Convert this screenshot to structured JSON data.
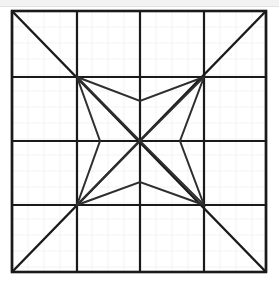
{
  "figure": {
    "title": "Concave four-pointed star inscribed in a gridded square",
    "canvas": {
      "width": 279,
      "height": 282
    },
    "colors": {
      "background": "#ffffff",
      "top_band": "#f2f2f2",
      "grid_major": "#1a1a1a",
      "grid_faint": "#f0f0f0",
      "star_stroke": "#2e2e2e",
      "diagonal_stroke": "#1a1a1a"
    },
    "stroke_widths": {
      "outer_border": 2.6,
      "grid_major": 2.2,
      "grid_faint": 0.8,
      "diagonal": 2.4,
      "star": 2.0
    },
    "square": {
      "left": 12,
      "top": 11,
      "right": 266,
      "bottom": 272,
      "width": 254,
      "height": 261
    },
    "grid": {
      "columns": 4,
      "rows": 4,
      "vertical_lines_x": [
        12,
        77,
        140,
        204,
        266
      ],
      "horizontal_lines_y": [
        11,
        77,
        141,
        205,
        272
      ],
      "faint_subdivision_step": 16
    },
    "diagonals": [
      {
        "name": "diagonal-top-left-to-bottom-right",
        "x1": 12,
        "y1": 11,
        "x2": 266,
        "y2": 272
      },
      {
        "name": "diagonal-top-right-to-bottom-left",
        "x1": 266,
        "y1": 11,
        "x2": 12,
        "y2": 272
      }
    ],
    "center": {
      "x": 140,
      "y": 141
    },
    "star": {
      "name": "concave-four-pointed-star",
      "point_count": 4,
      "outer_points": [
        {
          "label": "top-left",
          "x": 77,
          "y": 77
        },
        {
          "label": "top-right",
          "x": 204,
          "y": 77
        },
        {
          "label": "bottom-right",
          "x": 204,
          "y": 205
        },
        {
          "label": "bottom-left",
          "x": 77,
          "y": 205
        }
      ],
      "inner_points": [
        {
          "label": "top",
          "x": 140,
          "y": 101
        },
        {
          "label": "right",
          "x": 180,
          "y": 141
        },
        {
          "label": "bottom",
          "x": 140,
          "y": 182
        },
        {
          "label": "left",
          "x": 100,
          "y": 141
        }
      ],
      "outline_path": "M 77 77 L 140 101 L 204 77 L 180 141 L 204 205 L 140 182 L 77 205 L 100 141 Z",
      "spokes": [
        {
          "from": "top-left",
          "to": "center"
        },
        {
          "from": "top-right",
          "to": "center"
        },
        {
          "from": "bottom-right",
          "to": "center"
        },
        {
          "from": "bottom-left",
          "to": "center"
        }
      ]
    }
  },
  "chart_data": {
    "type": "diagram",
    "title": "Concave four-pointed star inscribed in a gridded square",
    "shapes": [
      {
        "kind": "rectangle",
        "name": "outer-square",
        "x": 12,
        "y": 11,
        "width": 254,
        "height": 261
      },
      {
        "kind": "grid",
        "name": "inner-grid",
        "cols": 4,
        "rows": 4
      },
      {
        "kind": "line",
        "name": "main-diagonal",
        "points": [
          [
            12,
            11
          ],
          [
            266,
            272
          ]
        ]
      },
      {
        "kind": "line",
        "name": "anti-diagonal",
        "points": [
          [
            266,
            11
          ],
          [
            12,
            272
          ]
        ]
      },
      {
        "kind": "polygon",
        "name": "star",
        "points": [
          [
            77,
            77
          ],
          [
            140,
            101
          ],
          [
            204,
            77
          ],
          [
            180,
            141
          ],
          [
            204,
            205
          ],
          [
            140,
            182
          ],
          [
            77,
            205
          ],
          [
            100,
            141
          ]
        ]
      }
    ]
  }
}
